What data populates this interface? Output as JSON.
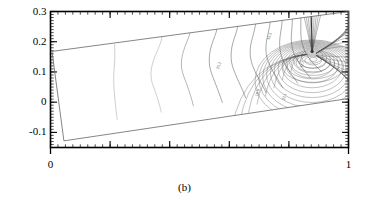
{
  "caption": "(b)",
  "chart_data": {
    "type": "line",
    "title": "",
    "subtitle": "",
    "xlabel": "",
    "ylabel": "",
    "xlim": [
      0,
      1
    ],
    "ylim": [
      -0.15,
      0.3
    ],
    "grid": false,
    "legend": null,
    "x_ticks": [
      0,
      1
    ],
    "x_tick_labels": [
      "0",
      "1"
    ],
    "x_minor_tick_count": 40,
    "y_ticks": [
      -0.1,
      0,
      0.1,
      0.2,
      0.3
    ],
    "y_tick_labels": [
      "-0.1",
      "0",
      "0.1",
      "0.2",
      "0.3"
    ],
    "y_minor_tick_count": 45,
    "frame": true,
    "plot_kind": "contour",
    "line_color": "#555555",
    "frame_color": "#000000",
    "domain_color": "#666666",
    "domain_outline": [
      [
        0.005,
        0.168
      ],
      [
        1.0,
        0.3
      ],
      [
        1.0,
        0.012
      ],
      [
        0.045,
        -0.128
      ]
    ],
    "singular_point": [
      0.878,
      0.168
    ],
    "contour_labels": [
      {
        "text": "25.2",
        "x": 0.565,
        "y": 0.108
      },
      {
        "text": "35.5",
        "x": 0.735,
        "y": 0.205
      },
      {
        "text": "18.9",
        "x": 0.695,
        "y": 0.018
      },
      {
        "text": "22.1",
        "x": 0.785,
        "y": 0.005
      },
      {
        "text": "31.7",
        "x": 0.845,
        "y": 0.112
      }
    ],
    "contours": [
      {
        "level": 5.0,
        "points": [
          [
            0.215,
            0.192
          ],
          [
            0.216,
            0.155
          ],
          [
            0.214,
            0.118
          ],
          [
            0.212,
            0.082
          ],
          [
            0.213,
            0.046
          ],
          [
            0.216,
            0.01
          ],
          [
            0.22,
            -0.026
          ],
          [
            0.224,
            -0.058
          ]
        ]
      },
      {
        "level": 10.0,
        "points": [
          [
            0.375,
            0.232
          ],
          [
            0.372,
            0.205
          ],
          [
            0.362,
            0.178
          ],
          [
            0.35,
            0.15
          ],
          [
            0.341,
            0.122
          ],
          [
            0.337,
            0.095
          ],
          [
            0.34,
            0.068
          ],
          [
            0.349,
            0.042
          ],
          [
            0.358,
            0.016
          ],
          [
            0.366,
            -0.01
          ],
          [
            0.372,
            -0.034
          ]
        ]
      },
      {
        "level": 14.0,
        "points": [
          [
            0.47,
            0.248
          ],
          [
            0.466,
            0.222
          ],
          [
            0.456,
            0.196
          ],
          [
            0.446,
            0.168
          ],
          [
            0.44,
            0.14
          ],
          [
            0.44,
            0.112
          ],
          [
            0.447,
            0.086
          ],
          [
            0.457,
            0.06
          ],
          [
            0.466,
            0.034
          ],
          [
            0.474,
            0.008
          ],
          [
            0.48,
            -0.014
          ]
        ]
      },
      {
        "level": 18.9,
        "points": [
          [
            0.56,
            0.258
          ],
          [
            0.556,
            0.232
          ],
          [
            0.546,
            0.204
          ],
          [
            0.537,
            0.176
          ],
          [
            0.533,
            0.148
          ],
          [
            0.534,
            0.12
          ],
          [
            0.541,
            0.094
          ],
          [
            0.551,
            0.068
          ],
          [
            0.561,
            0.042
          ],
          [
            0.57,
            0.018
          ],
          [
            0.577,
            -0.002
          ]
        ]
      },
      {
        "level": 22.1,
        "points": [
          [
            0.63,
            0.266
          ],
          [
            0.626,
            0.24
          ],
          [
            0.617,
            0.212
          ],
          [
            0.609,
            0.184
          ],
          [
            0.606,
            0.156
          ],
          [
            0.608,
            0.13
          ],
          [
            0.616,
            0.104
          ],
          [
            0.626,
            0.08
          ],
          [
            0.637,
            0.056
          ],
          [
            0.647,
            0.034
          ],
          [
            0.655,
            0.014
          ]
        ]
      },
      {
        "level": 25.2,
        "points": [
          [
            0.69,
            0.272
          ],
          [
            0.686,
            0.246
          ],
          [
            0.679,
            0.218
          ],
          [
            0.672,
            0.19
          ],
          [
            0.67,
            0.164
          ],
          [
            0.673,
            0.138
          ],
          [
            0.681,
            0.114
          ],
          [
            0.692,
            0.09
          ],
          [
            0.704,
            0.068
          ],
          [
            0.715,
            0.048
          ],
          [
            0.724,
            0.03
          ]
        ]
      },
      {
        "level": 28.0,
        "points": [
          [
            0.738,
            0.278
          ],
          [
            0.735,
            0.25
          ],
          [
            0.729,
            0.222
          ],
          [
            0.724,
            0.196
          ],
          [
            0.723,
            0.17
          ],
          [
            0.727,
            0.146
          ],
          [
            0.736,
            0.122
          ],
          [
            0.747,
            0.1
          ],
          [
            0.76,
            0.08
          ],
          [
            0.771,
            0.062
          ],
          [
            0.781,
            0.046
          ]
        ]
      },
      {
        "level": 31.7,
        "points": [
          [
            0.778,
            0.282
          ],
          [
            0.776,
            0.254
          ],
          [
            0.772,
            0.228
          ],
          [
            0.769,
            0.202
          ],
          [
            0.77,
            0.176
          ],
          [
            0.775,
            0.152
          ],
          [
            0.784,
            0.13
          ],
          [
            0.796,
            0.11
          ],
          [
            0.808,
            0.092
          ],
          [
            0.82,
            0.076
          ],
          [
            0.83,
            0.062
          ]
        ]
      },
      {
        "level": 35.5,
        "points": [
          [
            0.812,
            0.286
          ],
          [
            0.811,
            0.258
          ],
          [
            0.809,
            0.232
          ],
          [
            0.808,
            0.206
          ],
          [
            0.811,
            0.182
          ],
          [
            0.817,
            0.16
          ],
          [
            0.827,
            0.14
          ],
          [
            0.839,
            0.122
          ],
          [
            0.851,
            0.106
          ],
          [
            0.863,
            0.092
          ],
          [
            0.873,
            0.08
          ]
        ]
      },
      {
        "level": 38.0,
        "points": [
          [
            0.84,
            0.288
          ],
          [
            0.84,
            0.262
          ],
          [
            0.84,
            0.236
          ],
          [
            0.841,
            0.212
          ],
          [
            0.846,
            0.19
          ],
          [
            0.853,
            0.17
          ],
          [
            0.863,
            0.152
          ],
          [
            0.875,
            0.136
          ],
          [
            0.888,
            0.122
          ],
          [
            0.9,
            0.11
          ],
          [
            0.911,
            0.1
          ]
        ]
      }
    ],
    "radial_contours": {
      "center": [
        0.878,
        0.168
      ],
      "count": 14,
      "description": "dense fan of contour lines converging at the singular point"
    }
  }
}
